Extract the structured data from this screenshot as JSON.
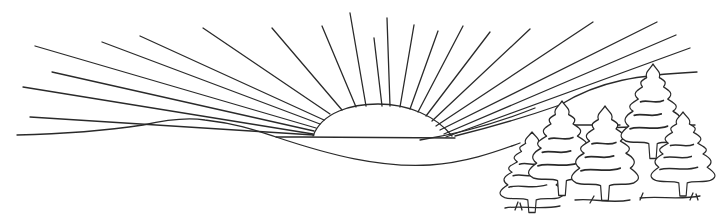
{
  "illustration": {
    "subject": "Line-art sunrise over hills with pine trees",
    "style": "black outline coloring page",
    "colors": {
      "line": "#2a2a2a",
      "background": "#ffffff"
    },
    "elements": [
      "half sun on horizon",
      "radiating sun rays",
      "rolling hills",
      "five pine trees",
      "grass tufts"
    ]
  }
}
